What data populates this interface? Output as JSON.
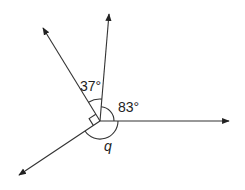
{
  "diagram": {
    "type": "angles-at-a-point",
    "center": [
      100,
      121
    ],
    "rays": [
      {
        "name": "ray-right",
        "end": [
          229,
          121
        ]
      },
      {
        "name": "ray-up",
        "end": [
          109,
          14
        ]
      },
      {
        "name": "ray-upper-left",
        "end": [
          43,
          28
        ]
      },
      {
        "name": "ray-lower-left",
        "end": [
          19,
          175
        ]
      }
    ],
    "labels": {
      "angle_top": "37°",
      "angle_right": "83°",
      "angle_bottom": "q"
    },
    "right_angle_marker": true,
    "stroke_color": "#333333"
  }
}
